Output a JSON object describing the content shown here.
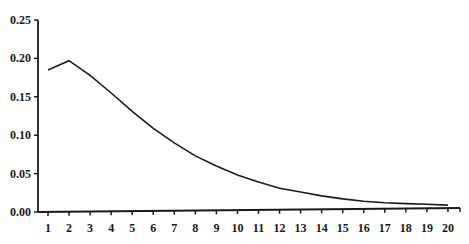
{
  "chart_data": {
    "type": "line",
    "title": "",
    "xlabel": "",
    "ylabel": "",
    "x": [
      1,
      2,
      3,
      4,
      5,
      6,
      7,
      8,
      9,
      10,
      11,
      12,
      13,
      14,
      15,
      16,
      17,
      18,
      19,
      20
    ],
    "series": [
      {
        "name": "",
        "values": [
          0.185,
          0.197,
          0.178,
          0.155,
          0.131,
          0.109,
          0.09,
          0.073,
          0.06,
          0.048,
          0.039,
          0.031,
          0.026,
          0.021,
          0.017,
          0.014,
          0.012,
          0.011,
          0.01,
          0.009
        ]
      }
    ],
    "ylim": [
      0,
      0.25
    ],
    "yticks": [
      "0.00",
      "0.05",
      "0.10",
      "0.15",
      "0.20",
      "0.25"
    ],
    "xticks": [
      "1",
      "2",
      "3",
      "4",
      "5",
      "6",
      "7",
      "8",
      "9",
      "10",
      "11",
      "12",
      "13",
      "14",
      "15",
      "16",
      "17",
      "18",
      "19",
      "20"
    ],
    "grid": false,
    "legend": null,
    "line_color": "#1a1a1a"
  }
}
